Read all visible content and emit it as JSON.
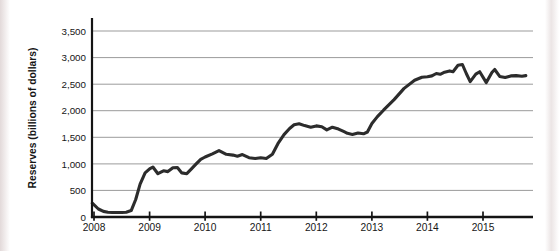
{
  "page": {
    "background": "#ffffff"
  },
  "chart_data": {
    "type": "line",
    "title": "",
    "xlabel": "",
    "ylabel": "Reserves (billions of dollars)",
    "x_ticks": [
      2008,
      2009,
      2010,
      2011,
      2012,
      2013,
      2014,
      2015
    ],
    "x_tick_labels": [
      "2008",
      "2009",
      "2010",
      "2011",
      "2012",
      "2013",
      "2014",
      "2015"
    ],
    "y_ticks": [
      0,
      500,
      1000,
      1500,
      2000,
      2500,
      3000,
      3500
    ],
    "y_tick_labels": [
      "0",
      "500",
      "1,000",
      "1,500",
      "2,000",
      "2,500",
      "3,000",
      "3,500"
    ],
    "xlim": [
      2008,
      2015.93
    ],
    "ylim": [
      0,
      3500
    ],
    "grid": "horizontal",
    "legend": "none",
    "line_color": "#2c2c2c",
    "axis_color": "#141414",
    "grid_color": "#9b9b9b",
    "series": [
      {
        "name": "reserves",
        "points": [
          [
            2007.97,
            260
          ],
          [
            2008.08,
            150
          ],
          [
            2008.17,
            105
          ],
          [
            2008.25,
            90
          ],
          [
            2008.33,
            85
          ],
          [
            2008.42,
            85
          ],
          [
            2008.5,
            85
          ],
          [
            2008.58,
            90
          ],
          [
            2008.67,
            120
          ],
          [
            2008.75,
            330
          ],
          [
            2008.83,
            620
          ],
          [
            2008.92,
            830
          ],
          [
            2009.0,
            905
          ],
          [
            2009.06,
            940
          ],
          [
            2009.15,
            815
          ],
          [
            2009.25,
            870
          ],
          [
            2009.33,
            855
          ],
          [
            2009.42,
            925
          ],
          [
            2009.5,
            930
          ],
          [
            2009.58,
            830
          ],
          [
            2009.67,
            815
          ],
          [
            2009.75,
            900
          ],
          [
            2009.83,
            990
          ],
          [
            2009.92,
            1085
          ],
          [
            2010.0,
            1130
          ],
          [
            2010.13,
            1190
          ],
          [
            2010.25,
            1250
          ],
          [
            2010.38,
            1180
          ],
          [
            2010.5,
            1165
          ],
          [
            2010.58,
            1145
          ],
          [
            2010.67,
            1175
          ],
          [
            2010.79,
            1115
          ],
          [
            2010.9,
            1100
          ],
          [
            2011.0,
            1115
          ],
          [
            2011.1,
            1100
          ],
          [
            2011.21,
            1180
          ],
          [
            2011.31,
            1380
          ],
          [
            2011.42,
            1550
          ],
          [
            2011.52,
            1665
          ],
          [
            2011.6,
            1735
          ],
          [
            2011.69,
            1755
          ],
          [
            2011.79,
            1720
          ],
          [
            2011.9,
            1690
          ],
          [
            2012.0,
            1715
          ],
          [
            2012.1,
            1700
          ],
          [
            2012.19,
            1640
          ],
          [
            2012.29,
            1690
          ],
          [
            2012.4,
            1655
          ],
          [
            2012.5,
            1605
          ],
          [
            2012.56,
            1575
          ],
          [
            2012.65,
            1555
          ],
          [
            2012.75,
            1580
          ],
          [
            2012.85,
            1565
          ],
          [
            2012.92,
            1600
          ],
          [
            2013.0,
            1760
          ],
          [
            2013.1,
            1890
          ],
          [
            2013.21,
            2010
          ],
          [
            2013.4,
            2210
          ],
          [
            2013.58,
            2420
          ],
          [
            2013.77,
            2575
          ],
          [
            2013.9,
            2630
          ],
          [
            2014.0,
            2640
          ],
          [
            2014.08,
            2655
          ],
          [
            2014.16,
            2700
          ],
          [
            2014.23,
            2685
          ],
          [
            2014.31,
            2725
          ],
          [
            2014.4,
            2750
          ],
          [
            2014.46,
            2735
          ],
          [
            2014.55,
            2855
          ],
          [
            2014.63,
            2870
          ],
          [
            2014.7,
            2700
          ],
          [
            2014.77,
            2548
          ],
          [
            2014.87,
            2690
          ],
          [
            2014.94,
            2735
          ],
          [
            2015.06,
            2530
          ],
          [
            2015.16,
            2720
          ],
          [
            2015.21,
            2775
          ],
          [
            2015.3,
            2645
          ],
          [
            2015.4,
            2625
          ],
          [
            2015.5,
            2655
          ],
          [
            2015.6,
            2660
          ],
          [
            2015.7,
            2650
          ],
          [
            2015.77,
            2660
          ]
        ]
      }
    ]
  }
}
